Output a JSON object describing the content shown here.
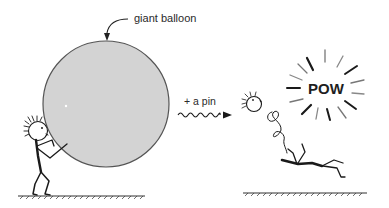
{
  "labels": {
    "balloon_callout": "giant balloon",
    "pin_label": "+ a pin",
    "burst_text": "POW"
  },
  "colors": {
    "balloon_fill": "#d3d3d3",
    "balloon_stroke": "#555555",
    "ink": "#1a1a1a",
    "background": "#ffffff"
  },
  "scenes": [
    {
      "name": "before",
      "description": "Stick figure pushing a giant balloon"
    },
    {
      "name": "after",
      "description": "Balloon popped: POW burst, figure knocked flat, head flying off on a spring"
    }
  ]
}
